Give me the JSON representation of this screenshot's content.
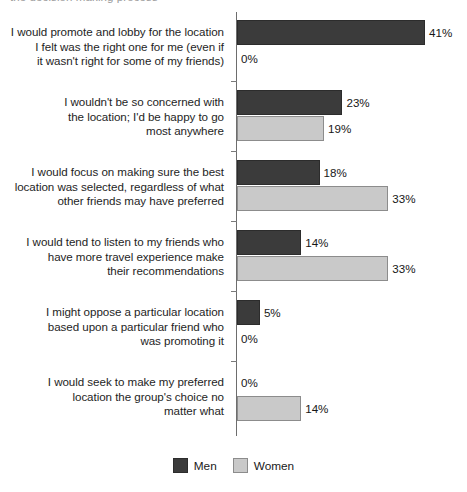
{
  "top_clipped_caption": "the decision making process",
  "chart_data": {
    "type": "bar",
    "orientation": "horizontal",
    "title": "",
    "subtitle": "",
    "xlabel": "",
    "ylabel": "",
    "grid": false,
    "axis_ticks_visible": false,
    "value_suffix": "%",
    "legend_position": "bottom-center",
    "categories": [
      "I would promote and lobby for the location I felt was the right one for me (even if it wasn't right for some of my friends)",
      "I wouldn't be so concerned with the location; I'd be happy to go most anywhere",
      "I would focus on making sure the best location was selected, regardless of what other friends may have preferred",
      "I would tend to listen to my friends who have more travel experience make their recommendations",
      "I might oppose a particular location based upon a particular friend who was promoting it",
      "I would seek to make my preferred location the group's choice no matter what"
    ],
    "category_lines": [
      [
        "I would promote and lobby for the location",
        "I felt was the right one for me (even if",
        "it wasn't right for some of my friends)"
      ],
      [
        "I wouldn't be so concerned with",
        "the location; I'd be happy to go",
        "most anywhere"
      ],
      [
        "I would focus on making sure the best",
        "location was selected, regardless of what",
        "other friends may have preferred"
      ],
      [
        "I would tend to listen to my friends who",
        "have more travel experience make",
        "their recommendations"
      ],
      [
        "I might oppose a particular location",
        "based upon a particular friend who",
        "was promoting it"
      ],
      [
        "I would seek to make my preferred",
        "location the group's choice no",
        "matter what"
      ]
    ],
    "series": [
      {
        "name": "Men",
        "color": "#3b3b3b",
        "values": [
          41,
          23,
          18,
          14,
          5,
          0
        ],
        "labels": [
          "41%",
          "23%",
          "18%",
          "14%",
          "5%",
          "0%"
        ]
      },
      {
        "name": "Women",
        "color": "#c9c9c9",
        "values": [
          0,
          19,
          33,
          33,
          0,
          14
        ],
        "labels": [
          "0%",
          "19%",
          "33%",
          "33%",
          "0%",
          "14%"
        ]
      }
    ],
    "xlim": [
      0,
      45
    ]
  },
  "legend": {
    "items": [
      {
        "label": "Men",
        "swatch": "men"
      },
      {
        "label": "Women",
        "swatch": "women"
      }
    ]
  }
}
